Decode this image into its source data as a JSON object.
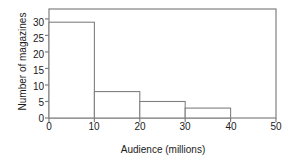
{
  "chart_data": {
    "type": "bar",
    "title": "",
    "subtitle": "",
    "xlabel": "Audience (millions)",
    "ylabel": "Number of magazines",
    "bin_edges": [
      0,
      10,
      20,
      30,
      40
    ],
    "categories": [
      "0-10",
      "10-20",
      "20-30",
      "30-40"
    ],
    "values": [
      29,
      8,
      5,
      3
    ],
    "xlim": [
      0,
      50
    ],
    "ylim": [
      0,
      33
    ],
    "xticks": [
      0,
      10,
      20,
      30,
      40,
      50
    ],
    "xtick_labels": [
      "0",
      "10",
      "20",
      "30",
      "40",
      "50"
    ],
    "yticks": [
      0,
      5,
      10,
      15,
      20,
      25,
      30
    ],
    "ytick_labels": [
      "0",
      "5",
      "10",
      "15",
      "20",
      "25",
      "30"
    ],
    "grid": false,
    "legend": false,
    "legend_position": "none",
    "bar_fill": "#ffffff",
    "bar_stroke": "#808080",
    "axis_color": "#808080",
    "text_color": "#1a1a1a",
    "background": "#ffffff",
    "frame": "full-box"
  }
}
